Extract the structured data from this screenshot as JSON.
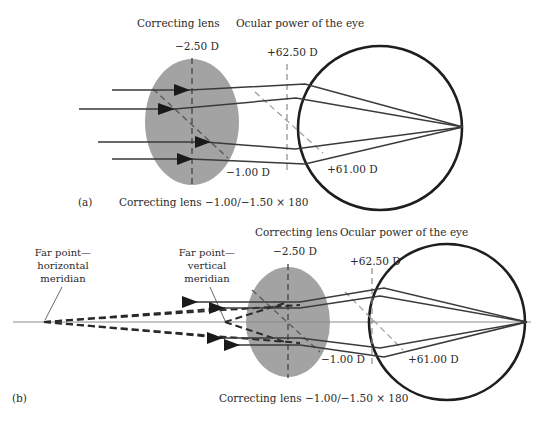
{
  "panel_a": {
    "id_label": "(a)",
    "lens_title": "Correcting lens",
    "eye_title": "Ocular power of the eye",
    "lens_vertical_power": "−2.50 D",
    "lens_oblique_power": "−1.00 D",
    "eye_power_vertical": "+62.50 D",
    "eye_power_oblique": "+61.00 D",
    "caption": "Correcting lens −1.00/−1.50 × 180"
  },
  "panel_b": {
    "id_label": "(b)",
    "lens_title": "Correcting lens",
    "eye_title": "Ocular power of the eye",
    "lens_vertical_power": "−2.50 D",
    "lens_oblique_power": "−1.00 D",
    "eye_power_vertical": "+62.50 D",
    "eye_power_oblique": "+61.00 D",
    "far_point_horizontal": [
      "Far point—",
      "horizontal",
      "meridian"
    ],
    "far_point_vertical": [
      "Far point—",
      "vertical",
      "meridian"
    ],
    "caption": "Correcting lens −1.00/−1.50 × 180"
  },
  "colors": {
    "lens_fill": "#a3a3a3",
    "ray": "#3a3a3a",
    "eye_outline": "#1e1e1e",
    "dashed_meridian": "#8a8a8a",
    "axis_line": "#8c8c8c"
  }
}
